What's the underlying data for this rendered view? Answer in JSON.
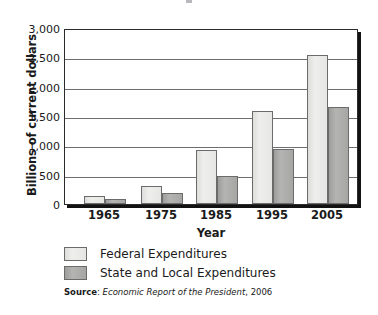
{
  "chart_data": {
    "type": "bar",
    "title": "",
    "xlabel": "Year",
    "ylabel": "Billions of current dollars",
    "categories": [
      "1965",
      "1975",
      "1985",
      "1995",
      "2005"
    ],
    "series": [
      {
        "name": "Federal Expenditures",
        "values": [
          140,
          300,
          920,
          1590,
          2545
        ],
        "color": "#e6e6e4"
      },
      {
        "name": "State and Local Expenditures",
        "values": [
          85,
          195,
          470,
          945,
          1650
        ],
        "color": "#a6a6a4"
      }
    ],
    "ylim": [
      0,
      3000
    ],
    "yticks": [
      0,
      500,
      1000,
      1500,
      2000,
      2500,
      3000
    ],
    "ytick_labels": [
      "0",
      "500",
      "1,000",
      "1,500",
      "2,000",
      "2,500",
      "3,000"
    ],
    "grid": true,
    "legend_position": "bottom-left",
    "source_prefix": "Source",
    "source_separator": ": ",
    "source_italic": "Economic Report of the President",
    "source_suffix": ", 2006"
  }
}
